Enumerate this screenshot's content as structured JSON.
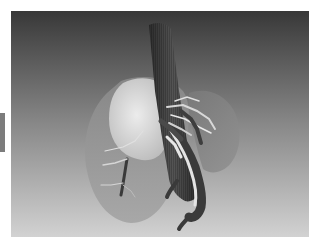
{
  "scene": {
    "subject": "3D liver rendering with hepatic vasculature",
    "parts": [
      "liver-left-lobe",
      "liver-right-lobe",
      "liver-caudate-highlight",
      "inferior-vena-cava",
      "portal-vein-branches"
    ]
  },
  "colors": {
    "background_top": "#383838",
    "background_bottom": "#cfcfcf",
    "side_tab": "#7c7c7c",
    "liver_translucent": "#8e8e8e",
    "liver_highlight": "#d9d9d9",
    "vessel_dark": "#3c3c3c",
    "vessel_light": "#e6e6e6"
  }
}
